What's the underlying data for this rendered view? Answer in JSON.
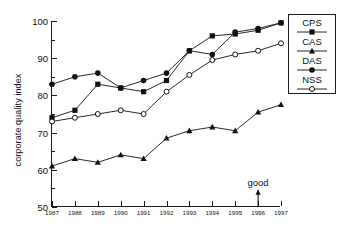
{
  "chart_data": {
    "type": "line",
    "title": "",
    "xlabel": "",
    "ylabel": "corporate quality index",
    "x": [
      1987,
      1988,
      1989,
      1990,
      1991,
      1992,
      1993,
      1994,
      1995,
      1996,
      1997
    ],
    "xtick_labels": [
      "1987",
      "1988",
      "1989",
      "1990",
      "1991",
      "1992",
      "1993",
      "1994",
      "1995",
      "1996",
      "1997"
    ],
    "ytick_labels": [
      "50",
      "60",
      "70",
      "80",
      "90",
      "100"
    ],
    "yticks": [
      50,
      60,
      70,
      80,
      90,
      100
    ],
    "ylim": [
      50,
      100
    ],
    "xlim": [
      1987,
      1997
    ],
    "grid": false,
    "legend_position": "right-outside",
    "series": [
      {
        "name": "CPS",
        "marker": "filled-square",
        "color": "#111111",
        "values": [
          74,
          76,
          83,
          82,
          81,
          84,
          92,
          96,
          96.5,
          97.5,
          99.5
        ]
      },
      {
        "name": "CAS",
        "marker": "filled-triangle",
        "color": "#111111",
        "values": [
          61,
          63,
          62,
          64,
          63,
          68.5,
          70.5,
          71.5,
          70.5,
          75.5,
          77.5
        ]
      },
      {
        "name": "DAS",
        "marker": "filled-circle",
        "color": "#111111",
        "values": [
          83,
          85,
          86,
          82,
          84,
          86,
          92,
          91,
          97,
          98,
          99.5
        ]
      },
      {
        "name": "NSS",
        "marker": "open-circle",
        "color": "#111111",
        "values": [
          73,
          74,
          75,
          76,
          75,
          81,
          85.5,
          89.5,
          91,
          92,
          94
        ]
      }
    ],
    "annotations": [
      {
        "text": "good",
        "x": 1996,
        "y": 56.5,
        "arrow": "up",
        "arrow_to_y": 52.2
      }
    ]
  },
  "legend": {
    "items": [
      {
        "label": "CPS",
        "marker": "filled-square"
      },
      {
        "label": "CAS",
        "marker": "filled-triangle"
      },
      {
        "label": "DAS",
        "marker": "filled-circle"
      },
      {
        "label": "NSS",
        "marker": "open-circle"
      }
    ]
  }
}
